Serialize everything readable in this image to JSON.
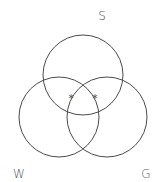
{
  "diagram": {
    "type": "venn",
    "sets": [
      {
        "id": "S",
        "label": "S",
        "cx": 83,
        "cy": 75,
        "r": 40,
        "label_x": 102,
        "label_y": 20
      },
      {
        "id": "W",
        "label": "W",
        "cx": 59,
        "cy": 117,
        "r": 40,
        "label_x": 19,
        "label_y": 178
      },
      {
        "id": "G",
        "label": "G",
        "cx": 107,
        "cy": 117,
        "r": 40,
        "label_x": 146,
        "label_y": 178
      }
    ],
    "marks": [
      {
        "symbol": "*",
        "x": 71,
        "y": 102,
        "region": "S∩W"
      },
      {
        "symbol": "*",
        "x": 95,
        "y": 102,
        "region": "S∩G"
      }
    ],
    "stroke_color": "#4a4a4a",
    "label_color": "#555555"
  }
}
